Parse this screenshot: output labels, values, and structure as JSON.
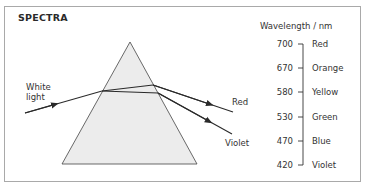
{
  "title": "SPECTRA",
  "prism": {
    "incoming_label_line1": "White",
    "incoming_label_line2": "light",
    "outgoing": [
      {
        "label": "Red"
      },
      {
        "label": "Violet"
      }
    ]
  },
  "scale": {
    "heading": "Wavelength / nm",
    "rows": [
      {
        "value": "700",
        "color": "Red"
      },
      {
        "value": "670",
        "color": "Orange"
      },
      {
        "value": "580",
        "color": "Yellow"
      },
      {
        "value": "530",
        "color": "Green"
      },
      {
        "value": "470",
        "color": "Blue"
      },
      {
        "value": "420",
        "color": "Violet"
      }
    ]
  },
  "colors": {
    "prism_fill": "#ececec",
    "line": "#2a2a2a",
    "border": "#a9a9a9"
  }
}
